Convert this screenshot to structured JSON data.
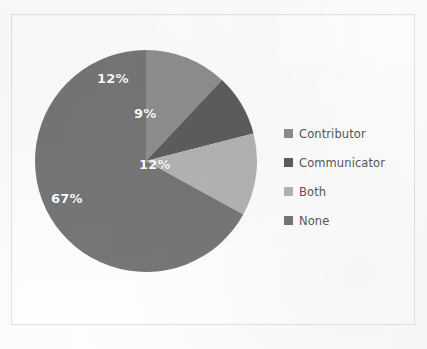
{
  "figure": {
    "background_color": "#fdfdfd",
    "frame_border_color": "#e3e3e5",
    "label_text_color": "#ffffff",
    "legend_text_color": "#565656"
  },
  "ghost_marks": [
    {
      "text": "",
      "left": 14,
      "top": 2
    },
    {
      "text": "",
      "left": 300,
      "top": 60
    },
    {
      "text": "",
      "left": 40,
      "top": 296
    },
    {
      "text": "",
      "left": 250,
      "top": 332
    },
    {
      "text": "",
      "left": 120,
      "top": 338
    }
  ],
  "chart_data": {
    "type": "pie",
    "title": "",
    "subtitle": "",
    "xlabel": "",
    "ylabel": "",
    "grid": false,
    "legend_position": "right",
    "start_angle_deg": 0,
    "direction": "clockwise",
    "categories": [
      "Contributor",
      "Communicator",
      "Both",
      "None"
    ],
    "values": [
      12,
      9,
      12,
      67
    ],
    "value_unit": "%",
    "data_labels": [
      "12%",
      "9%",
      "12%",
      "67%"
    ],
    "colors": [
      "#8e8e8e",
      "#5d5d5d",
      "#b4b4b4",
      "#767676"
    ],
    "slices": [
      {
        "name": "Contributor",
        "value": 12,
        "label": "12%",
        "color": "#8e8e8e",
        "start_deg": 0,
        "end_deg": 43.2,
        "label_left": 63,
        "label_top": 22
      },
      {
        "name": "Communicator",
        "value": 9,
        "label": "9%",
        "color": "#5d5d5d",
        "start_deg": 43.2,
        "end_deg": 75.6,
        "label_left": 100,
        "label_top": 57
      },
      {
        "name": "Both",
        "value": 12,
        "label": "12%",
        "color": "#b4b4b4",
        "start_deg": 75.6,
        "end_deg": 118.8,
        "label_left": 105,
        "label_top": 108
      },
      {
        "name": "None",
        "value": 67,
        "label": "67%",
        "color": "#767676",
        "start_deg": 118.8,
        "end_deg": 360,
        "label_left": 17,
        "label_top": 142
      }
    ]
  },
  "legend": {
    "items": [
      {
        "label": "Contributor",
        "color": "#8e8e8e"
      },
      {
        "label": "Communicator",
        "color": "#5d5d5d"
      },
      {
        "label": "Both",
        "color": "#b4b4b4"
      },
      {
        "label": "None",
        "color": "#767676"
      }
    ]
  }
}
